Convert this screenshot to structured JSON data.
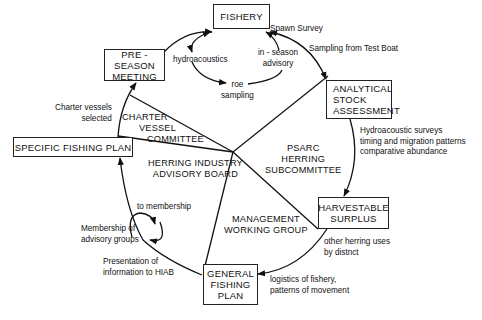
{
  "diagram": {
    "type": "herring management cycle",
    "boxes": {
      "fishery": [
        "FISHERY"
      ],
      "pre_season": [
        "PRE - SEASON",
        "MEETING"
      ],
      "analytical": [
        "ANALYTICAL",
        "STOCK",
        "ASSESSMENT"
      ],
      "specific_plan": [
        "SPECIFIC FISHING PLAN"
      ],
      "harvestable": [
        "HARVESTABLE",
        "SURPLUS"
      ],
      "general_plan": [
        "GENERAL",
        "FISHING",
        "PLAN"
      ]
    },
    "regions": {
      "charter": [
        "CHARTER",
        "VESSEL",
        "COMMITTEE"
      ],
      "hiab": [
        "HERRING INDUSTRY",
        "ADVISORY BOARD"
      ],
      "psarc": [
        "PSARC",
        "HERRING",
        "SUBCOMMITTEE"
      ],
      "mwg": [
        "MANAGEMENT",
        "WORKING GROUP"
      ]
    },
    "labels": {
      "spawn_survey": [
        "Spawn Survey"
      ],
      "test_boat": [
        "Sampling from Test Boat"
      ],
      "hydroacoustics": [
        "hydroacoustics"
      ],
      "in_season": [
        "in - season",
        "advisory"
      ],
      "roe_sampling": [
        "roe",
        "sampling"
      ],
      "charter_selected": [
        "Charter vessels",
        "selected"
      ],
      "hydro_surveys": [
        "Hydroacoustic surveys",
        "timing and migration patterns",
        "comparative abundance"
      ],
      "other_uses": [
        "other herring uses",
        "by distnct"
      ],
      "logistics": [
        "logistics of fishery,",
        "patterns of movement"
      ],
      "to_membership": [
        "to membership"
      ],
      "membership": [
        "Membership of",
        "advisory groups"
      ],
      "presentation": [
        "Presentation of",
        "information to HIAB"
      ]
    }
  }
}
